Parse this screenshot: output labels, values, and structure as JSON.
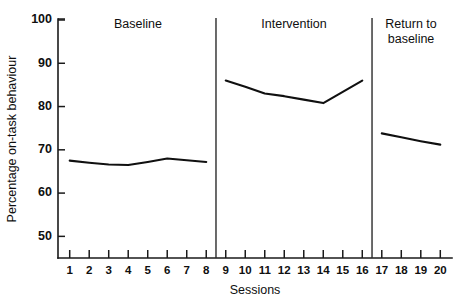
{
  "chart_data": {
    "type": "line",
    "title": "",
    "subtitle": "",
    "xlabel": "Sessions",
    "ylabel": "Percentage on-task behaviour",
    "xlim": [
      0.4,
      20.6
    ],
    "ylim": [
      45,
      100
    ],
    "grid": false,
    "legend_position": "none",
    "ytick_labels": [
      "100",
      "90",
      "80",
      "70",
      "60",
      "50"
    ],
    "ytick_values": [
      100,
      90,
      80,
      70,
      60,
      50
    ],
    "xtick_labels": [
      "1",
      "2",
      "3",
      "4",
      "5",
      "6",
      "7",
      "8",
      "9",
      "10",
      "11",
      "12",
      "13",
      "14",
      "15",
      "16",
      "17",
      "18",
      "19",
      "20"
    ],
    "xtick_values": [
      1,
      2,
      3,
      4,
      5,
      6,
      7,
      8,
      9,
      10,
      11,
      12,
      13,
      14,
      15,
      16,
      17,
      18,
      19,
      20
    ],
    "series": [
      {
        "name": "Baseline",
        "x": [
          1,
          2,
          3,
          4,
          5,
          6,
          7,
          8
        ],
        "values": [
          67.5,
          67.0,
          66.6,
          66.5,
          67.2,
          68.0,
          67.6,
          67.2
        ]
      },
      {
        "name": "Intervention",
        "x": [
          9,
          10,
          11,
          12,
          13,
          14,
          15,
          16
        ],
        "values": [
          86.0,
          84.6,
          83.0,
          82.4,
          81.6,
          80.8,
          83.4,
          86.0
        ]
      },
      {
        "name": "Return to baseline",
        "x": [
          17,
          18,
          19,
          20
        ],
        "values": [
          73.8,
          72.9,
          72.0,
          71.2
        ]
      }
    ],
    "phases": [
      {
        "label": "Baseline",
        "start": 1,
        "end": 8,
        "label_lines": [
          "Baseline"
        ]
      },
      {
        "label": "Intervention",
        "start": 9,
        "end": 16,
        "label_lines": [
          "Intervention"
        ]
      },
      {
        "label": "Return to baseline",
        "start": 17,
        "end": 20,
        "label_lines": [
          "Return to",
          "baseline"
        ]
      }
    ],
    "phase_dividers": [
      8.5,
      16.5
    ],
    "colors": {
      "line": "#101010",
      "axis": "#1a1a1a",
      "divider": "#2b2b2b",
      "background": "#ffffff"
    }
  }
}
